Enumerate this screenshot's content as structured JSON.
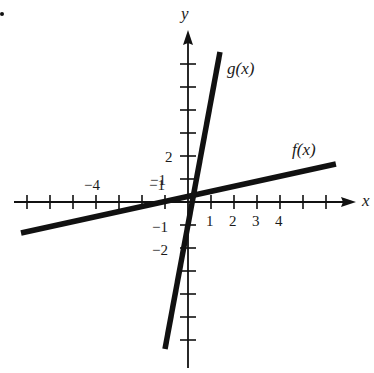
{
  "chart_data": {
    "type": "line",
    "title": "",
    "xlabel": "x",
    "ylabel": "y",
    "xlim": [
      -7.3,
      7.2
    ],
    "ylim": [
      -7.2,
      7.4
    ],
    "grid": false,
    "legend": "none (lines labeled inline)",
    "x_ticks": [
      -7,
      -6,
      -5,
      -4,
      -3,
      -2,
      -1,
      1,
      2,
      3,
      4,
      5,
      6
    ],
    "y_ticks": [
      -6,
      -5,
      -4,
      -3,
      -2,
      -1,
      1,
      2,
      3,
      4,
      5,
      6
    ],
    "x_tick_labels": [
      {
        "value": -4,
        "text": "−4"
      },
      {
        "value": -1,
        "text": "−1"
      },
      {
        "value": 1,
        "text": "1"
      },
      {
        "value": 2,
        "text": "2"
      },
      {
        "value": 3,
        "text": "3"
      },
      {
        "value": 4,
        "text": "4"
      }
    ],
    "y_tick_labels": [
      {
        "value": 2,
        "text": "2"
      },
      {
        "value": 1,
        "text": "−1"
      },
      {
        "value": -1,
        "text": "−1"
      },
      {
        "value": -2,
        "text": "−2"
      }
    ],
    "series": [
      {
        "name": "f(x)",
        "label": "f(x)",
        "x": [
          -7.26,
          6.43
        ],
        "y": [
          -1.35,
          1.65
        ],
        "approx_slope": 0.22
      },
      {
        "name": "g(x)",
        "label": "g(x)",
        "x": [
          -1.0,
          1.39
        ],
        "y": [
          -6.39,
          6.52
        ],
        "approx_slope": 5.4
      }
    ],
    "annotations": [
      "f(x)",
      "g(x)"
    ]
  },
  "labels": {
    "x_axis": "x",
    "y_axis": "y",
    "f": "f(x)",
    "g": "g(x)",
    "xt_m4": "−4",
    "xt_m1": "−1",
    "xt_1": "1",
    "xt_2": "2",
    "xt_3": "3",
    "xt_4": "4",
    "yt_2": "2",
    "yt_1": "−1",
    "yt_m1": "−1",
    "yt_m2": "−2"
  },
  "colors": {
    "ink": "#111111",
    "background": "#ffffff"
  }
}
